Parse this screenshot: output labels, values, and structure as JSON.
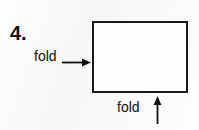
{
  "worksheet": {
    "item_number": "4.",
    "background_color": "#f7f7f7",
    "ink_color": "#111111"
  },
  "figure": {
    "shape_name": "paper-rectangle",
    "border_color": "#1a1a1a",
    "fill_color": "#fdfdfd",
    "dot": {
      "name": "hole-punch-dot",
      "color": "#111111"
    },
    "annotations": [
      {
        "label": "fold",
        "arrow_direction": "right",
        "position": "left-of-rectangle"
      },
      {
        "label": "fold",
        "arrow_direction": "up",
        "position": "below-rectangle"
      }
    ]
  }
}
